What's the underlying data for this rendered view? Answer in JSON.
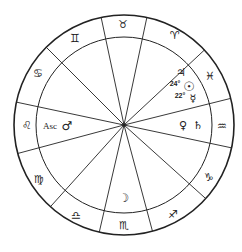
{
  "chart": {
    "center": [
      124,
      125
    ],
    "outer_radius": 110,
    "inner_radius": 88,
    "line_color": "#222222",
    "spoke_angles_deg": [
      -78,
      -102,
      -135,
      -168,
      165,
      132,
      103,
      75,
      42,
      12,
      -14,
      -43
    ]
  },
  "signs": [
    {
      "name": "Taurus",
      "glyph": "♉",
      "x": 123,
      "y": 24
    },
    {
      "name": "Aries",
      "glyph": "♈",
      "x": 175,
      "y": 35
    },
    {
      "name": "Pisces",
      "glyph": "♓",
      "x": 210,
      "y": 76
    },
    {
      "name": "Aquarius",
      "glyph": "♒",
      "x": 222,
      "y": 126
    },
    {
      "name": "Capricorn",
      "glyph": "♑",
      "x": 209,
      "y": 177
    },
    {
      "name": "Sagittarius",
      "glyph": "♐",
      "x": 173,
      "y": 214
    },
    {
      "name": "Scorpio",
      "glyph": "♏",
      "x": 124,
      "y": 225
    },
    {
      "name": "Libra",
      "glyph": "♎",
      "x": 76,
      "y": 215
    },
    {
      "name": "Virgo",
      "glyph": "♍",
      "x": 39,
      "y": 179
    },
    {
      "name": "Leo",
      "glyph": "♌",
      "x": 27,
      "y": 125
    },
    {
      "name": "Cancer",
      "glyph": "♋",
      "x": 38,
      "y": 73
    },
    {
      "name": "Gemini",
      "glyph": "♊",
      "x": 75,
      "y": 38
    }
  ],
  "planets": [
    {
      "name": "Jupiter",
      "glyph": "♃",
      "x": 181,
      "y": 72
    },
    {
      "name": "Sun",
      "glyph": "☉",
      "x": 189,
      "y": 86,
      "degree": "24°",
      "degree_x": 175,
      "degree_y": 83
    },
    {
      "name": "Mercury",
      "glyph": "☿",
      "x": 193,
      "y": 98,
      "degree": "22°",
      "degree_x": 180,
      "degree_y": 95
    },
    {
      "name": "Venus",
      "glyph": "♀",
      "x": 183,
      "y": 125
    },
    {
      "name": "Saturn",
      "glyph": "♄",
      "x": 198,
      "y": 125
    },
    {
      "name": "Mars",
      "glyph": "♂",
      "x": 67,
      "y": 126
    },
    {
      "name": "Moon",
      "glyph": "☽",
      "x": 124,
      "y": 198
    }
  ],
  "ascendant": {
    "label": "Asc",
    "x": 50,
    "y": 126
  }
}
